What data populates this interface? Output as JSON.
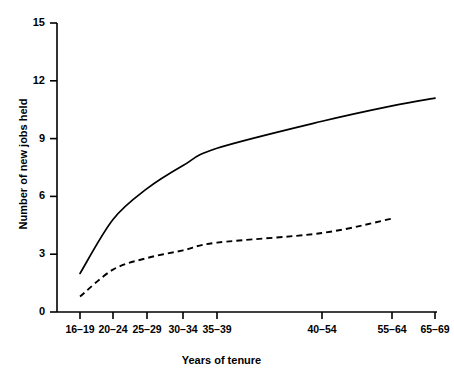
{
  "chart_data": {
    "type": "line",
    "title": "",
    "xlabel": "Years of tenure",
    "ylabel": "Number of new jobs held",
    "categories": [
      "16–19",
      "20–24",
      "25–29",
      "30–34",
      "35–39",
      "40–54",
      "55–64",
      "65–69"
    ],
    "xtick_labels": [
      "16–19",
      "20–24",
      "25–29",
      "30–34",
      "35–39",
      "40–54",
      "55–64",
      "65–69"
    ],
    "ytick_labels": [
      "0",
      "3",
      "6",
      "9",
      "12",
      "15"
    ],
    "ytick_values": [
      0,
      3,
      6,
      9,
      12,
      15
    ],
    "ylim": [
      0,
      15
    ],
    "grid": false,
    "legend": "none",
    "series": [
      {
        "name": "solid-curve",
        "style": "solid",
        "color": "#000000",
        "values": [
          2.0,
          4.8,
          6.4,
          7.6,
          8.5,
          9.9,
          10.7,
          11.1
        ]
      },
      {
        "name": "dashed-curve",
        "style": "dashed",
        "color": "#000000",
        "values": [
          0.8,
          2.2,
          2.8,
          3.2,
          3.6,
          4.1,
          4.85,
          null
        ]
      }
    ]
  },
  "axes": {
    "y_label": "Number of new jobs held",
    "x_label": "Years of tenure"
  }
}
